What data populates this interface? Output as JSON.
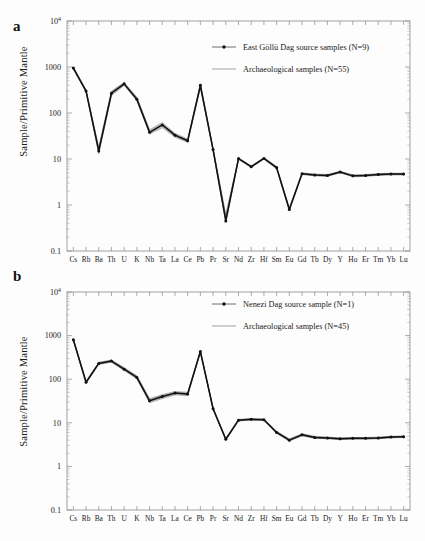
{
  "figure": {
    "background": "#fdfdfd",
    "accent": "#111111",
    "band_color": "#5b5b5b"
  },
  "panels": [
    {
      "id": "a",
      "label": "a",
      "ylabel": "Sample/Primitive Mantle",
      "legend": [
        {
          "label": "East Göllü Dag source samples (N=9)",
          "style": "line-marker"
        },
        {
          "label": "Archaeological samples (N=55)",
          "style": "line"
        }
      ]
    },
    {
      "id": "b",
      "label": "b",
      "ylabel": "Sample/Primitive Mantle",
      "legend": [
        {
          "label": "Nenezi Dag source sample (N=1)",
          "style": "line-marker"
        },
        {
          "label": "Archaeological samples (N=45)",
          "style": "line"
        }
      ]
    }
  ],
  "chart_data": [
    {
      "type": "line",
      "panel": "a",
      "title": "",
      "xlabel": "",
      "ylabel": "Sample/Primitive Mantle",
      "yscale": "log",
      "ylim": [
        0.1,
        10000
      ],
      "ytick_labels": [
        "10⁴",
        "1000",
        "100",
        "10",
        "1",
        "0.1"
      ],
      "ytick_values": [
        10000,
        1000,
        100,
        10,
        1,
        0.1
      ],
      "grid": false,
      "legend_position": "top-right",
      "categories": [
        "Cs",
        "Rb",
        "Ba",
        "Th",
        "U",
        "K",
        "Nb",
        "Ta",
        "La",
        "Ce",
        "Pb",
        "Pr",
        "Sr",
        "Nd",
        "Zr",
        "Hf",
        "Sm",
        "Eu",
        "Gd",
        "Tb",
        "Dy",
        "Y",
        "Ho",
        "Er",
        "Tm",
        "Yb",
        "Lu"
      ],
      "series": [
        {
          "name": "East Göllü Dag source samples (N=9)",
          "values": [
            950,
            300,
            15,
            270,
            430,
            200,
            38,
            55,
            33,
            25,
            400,
            16,
            0.45,
            10.2,
            6.8,
            10.3,
            6.5,
            0.8,
            4.8,
            4.5,
            4.4,
            5.2,
            4.3,
            4.4,
            4.6,
            4.7,
            4.7
          ]
        },
        {
          "name": "Archaeological samples (N=55) upper envelope",
          "values": [
            1000,
            320,
            18,
            300,
            460,
            220,
            43,
            62,
            36,
            27,
            430,
            17,
            0.62,
            10.6,
            7.1,
            10.7,
            6.9,
            0.86,
            5.0,
            4.7,
            4.6,
            5.4,
            4.5,
            4.6,
            4.8,
            4.9,
            4.9
          ]
        },
        {
          "name": "Archaeological samples (N=55) lower envelope",
          "values": [
            900,
            285,
            13,
            240,
            400,
            185,
            35,
            48,
            30,
            23,
            350,
            15,
            0.42,
            9.8,
            6.5,
            9.9,
            6.1,
            0.76,
            4.6,
            4.3,
            4.2,
            5.0,
            4.1,
            4.2,
            4.4,
            4.5,
            4.5
          ]
        }
      ]
    },
    {
      "type": "line",
      "panel": "b",
      "title": "",
      "xlabel": "",
      "ylabel": "Sample/Primitive Mantle",
      "yscale": "log",
      "ylim": [
        0.1,
        10000
      ],
      "ytick_labels": [
        "10⁴",
        "1000",
        "100",
        "10",
        "1",
        "0.1"
      ],
      "ytick_values": [
        10000,
        1000,
        100,
        10,
        1,
        0.1
      ],
      "grid": false,
      "legend_position": "top-right",
      "categories": [
        "Cs",
        "Rb",
        "Ba",
        "Th",
        "U",
        "K",
        "Nb",
        "Ta",
        "La",
        "Ce",
        "Pb",
        "Pr",
        "Sr",
        "Nd",
        "Zr",
        "Hf",
        "Sm",
        "Eu",
        "Gd",
        "Tb",
        "Dy",
        "Y",
        "Ho",
        "Er",
        "Tm",
        "Yb",
        "Lu"
      ],
      "series": [
        {
          "name": "Nenezi Dag source sample (N=1)",
          "values": [
            800,
            85,
            230,
            260,
            170,
            110,
            32,
            40,
            48,
            46,
            430,
            21,
            4.2,
            11.5,
            12.0,
            11.8,
            6.0,
            4.0,
            5.3,
            4.6,
            4.5,
            4.3,
            4.4,
            4.4,
            4.5,
            4.7,
            4.8
          ]
        },
        {
          "name": "Archaeological samples (N=45) upper envelope",
          "values": [
            840,
            90,
            245,
            275,
            185,
            120,
            36,
            44,
            52,
            50,
            450,
            22,
            4.4,
            12.0,
            12.5,
            12.3,
            6.4,
            4.3,
            5.6,
            4.9,
            4.7,
            4.5,
            4.6,
            4.6,
            4.7,
            4.9,
            5.0
          ]
        },
        {
          "name": "Archaeological samples (N=45) lower envelope",
          "values": [
            770,
            80,
            218,
            245,
            158,
            102,
            29,
            36,
            44,
            42,
            410,
            20,
            4.0,
            11.0,
            11.5,
            11.3,
            5.7,
            3.8,
            5.0,
            4.4,
            4.3,
            4.1,
            4.2,
            4.2,
            4.3,
            4.5,
            4.6
          ]
        }
      ]
    }
  ]
}
